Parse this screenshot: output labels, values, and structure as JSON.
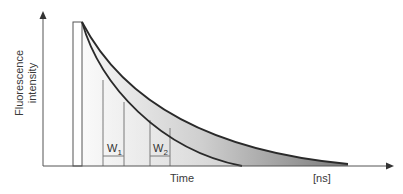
{
  "diagram": {
    "type": "time-gated fluorescence decay",
    "y_axis_label_line1": "Fluorescence",
    "y_axis_label_line2": "intensity",
    "x_axis_label": "Time",
    "x_axis_unit": "[ns]",
    "gates": [
      {
        "label": "W",
        "sub": "1"
      },
      {
        "label": "W",
        "sub": "2"
      }
    ],
    "curves": [
      {
        "name": "short-lifetime-decay",
        "description": "faster decay curve"
      },
      {
        "name": "long-lifetime-decay",
        "description": "slower decay curve"
      }
    ],
    "colors": {
      "curve": "#2a2a2a",
      "axis": "#555555",
      "fill_light": "#f2f2f2",
      "fill_dark": "#8a8a8a"
    }
  }
}
